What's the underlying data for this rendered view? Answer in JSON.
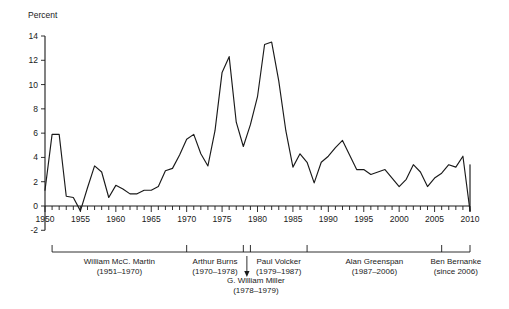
{
  "chart_data": {
    "type": "line",
    "title": "",
    "xlabel": "",
    "ylabel": "Percent",
    "xlim": [
      1950,
      2010
    ],
    "ylim": [
      -2,
      14
    ],
    "ytick_step": 2,
    "xtick_step": 1,
    "xtick_label_step": 5,
    "grid": false,
    "legend": "none",
    "yticks": [
      -2,
      0,
      2,
      4,
      6,
      8,
      10,
      12,
      14
    ],
    "xticks": [
      1950,
      1955,
      1960,
      1965,
      1970,
      1975,
      1980,
      1985,
      1990,
      1995,
      2000,
      2005,
      2010
    ],
    "series": [
      {
        "name": "Inflation rate",
        "x": [
          1950,
          1951,
          1952,
          1953,
          1954,
          1955,
          1956,
          1957,
          1958,
          1959,
          1960,
          1961,
          1962,
          1963,
          1964,
          1965,
          1966,
          1967,
          1968,
          1969,
          1970,
          1971,
          1972,
          1973,
          1974,
          1975,
          1976,
          1977,
          1978,
          1979,
          1980,
          1981,
          1982,
          1983,
          1984,
          1985,
          1986,
          1987,
          1988,
          1989,
          1990,
          1991,
          1992,
          1993,
          1994,
          1995,
          1996,
          1997,
          1998,
          1999,
          2000,
          2001,
          2002,
          2003,
          2004,
          2005,
          2006,
          2007,
          2008,
          2009,
          2010
        ],
        "values": [
          1.3,
          5.9,
          5.9,
          0.8,
          0.7,
          -0.4,
          1.5,
          3.3,
          2.8,
          0.7,
          1.7,
          1.4,
          1.0,
          1.0,
          1.3,
          1.3,
          1.6,
          2.9,
          3.1,
          4.2,
          5.5,
          5.9,
          4.3,
          3.3,
          6.2,
          11.0,
          12.3,
          6.9,
          4.9,
          6.7,
          9.0,
          13.3,
          13.5,
          10.3,
          6.2,
          3.2,
          4.3,
          3.6,
          1.9,
          3.6,
          4.1,
          4.8,
          5.4,
          4.2,
          3.0,
          3.0,
          2.6,
          2.8,
          3.0,
          2.3,
          1.6,
          2.2,
          3.4,
          2.8,
          1.6,
          2.3,
          2.7,
          3.4,
          3.2,
          4.1,
          -0.4
        ]
      }
    ],
    "final_value": 3.4
  },
  "annotations": {
    "chairs": [
      {
        "name": "William McC. Martin",
        "years": "(1951–1970)",
        "start": 1951,
        "end": 1970
      },
      {
        "name": "Arthur Burns",
        "years": "(1970–1978)",
        "start": 1970,
        "end": 1978
      },
      {
        "name": "G. William Miller",
        "years": "(1978–1979)",
        "start": 1978,
        "end": 1979
      },
      {
        "name": "Paul Volcker",
        "years": "(1979–1987)",
        "start": 1979,
        "end": 1987
      },
      {
        "name": "Alan Greenspan",
        "years": "(1987–2006)",
        "start": 1987,
        "end": 2006
      },
      {
        "name": "Ben Bernanke",
        "years": "(since 2006)",
        "start": 2006,
        "end": 2010
      }
    ]
  },
  "colors": {
    "line": "#1a1a1a",
    "axis": "#1a1a1a",
    "background": "#ffffff"
  }
}
